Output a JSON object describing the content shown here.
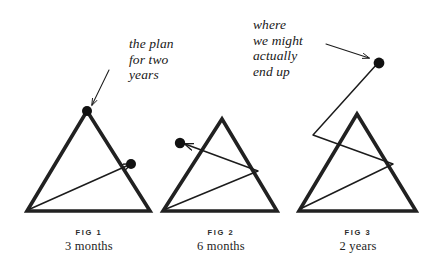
{
  "figure": {
    "title_annotations": [
      {
        "id": "plan",
        "text": "the plan\nfor two\nyears",
        "points_to": "fig1-apex-dot"
      },
      {
        "id": "actual",
        "text": "where\nwe might\nactually\nend up",
        "points_to": "fig3-outer-dot"
      }
    ],
    "annotation_plan": "the plan\nfor two\nyears",
    "annotation_actual": "where\nwe might\nactually\nend up",
    "captions": [
      {
        "label": "FIG 1",
        "sub": "3 months"
      },
      {
        "label": "FIG 2",
        "sub": "6 months"
      },
      {
        "label": "FIG 3",
        "sub": "2 years"
      }
    ],
    "colors": {
      "ink": "#1a1a1a",
      "background": "#ffffff",
      "stroke": "#212121"
    },
    "stroke_widths": {
      "triangle": 3.6,
      "path": 1.5,
      "arrow": 1.1
    },
    "dot_radius": 5,
    "shapes": {
      "triangle_1": {
        "apex": [
          87,
          111
        ],
        "base_left": [
          27,
          211
        ],
        "base_right": [
          150,
          211
        ]
      },
      "triangle_2": {
        "apex": [
          222,
          119
        ],
        "base_left": [
          163,
          211
        ],
        "base_right": [
          277,
          211
        ]
      },
      "triangle_3": {
        "apex": [
          357,
          114
        ],
        "base_left": [
          299,
          211
        ],
        "base_right": [
          416,
          211
        ]
      },
      "path_1": [
        [
          30,
          209
        ],
        [
          131,
          164
        ]
      ],
      "path_2": [
        [
          166,
          209
        ],
        [
          258,
          171
        ],
        [
          182,
          144
        ]
      ],
      "path_3": [
        [
          300,
          209
        ],
        [
          393,
          164
        ],
        [
          313,
          135
        ],
        [
          379,
          63
        ]
      ],
      "dot_1": [
        131,
        164
      ],
      "dot_2": [
        180,
        143
      ],
      "dot_3_apex": [
        87,
        111
      ],
      "dot_3_outer": [
        379,
        63
      ]
    },
    "arrows": {
      "plan_arrow": {
        "from": [
          109,
          71
        ],
        "to": [
          91,
          106
        ]
      },
      "actual_arrow": {
        "from": [
          327,
          45
        ],
        "to": [
          370,
          59
        ]
      }
    }
  }
}
